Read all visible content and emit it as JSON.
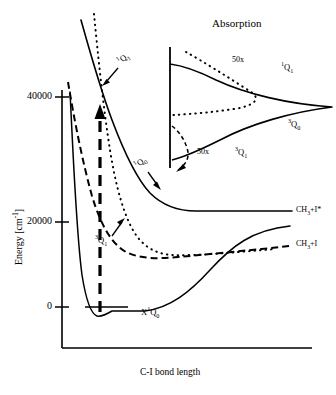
{
  "figure": {
    "axes": {
      "y_label": "Energy [cm-1]",
      "y_label_main": "Energy [cm",
      "y_label_exp": "-1",
      "y_label_close": "]",
      "x_label": "C-I bond length",
      "y_ticks": [
        "40000",
        "20000",
        "0"
      ],
      "y_tick_values": [
        40000,
        20000,
        0
      ]
    },
    "curves": [
      {
        "name": "X 1Q0",
        "label": "X",
        "label_sup": "1",
        "label_sub": "Q",
        "label_subidx": "0",
        "style": "solid",
        "role": "ground-state"
      },
      {
        "name": "3Q0",
        "label_sup": "3",
        "label_main": "Q",
        "label_sub": "0",
        "style": "solid",
        "role": "excited-state"
      },
      {
        "name": "1Q1",
        "label_sup": "1",
        "label_main": "Q",
        "label_sub": "1",
        "style": "dotted",
        "role": "excited-state"
      },
      {
        "name": "3Q1",
        "label_sup": "3",
        "label_main": "Q",
        "label_sub": "1",
        "style": "dashed",
        "role": "excited-state"
      }
    ],
    "state_labels": {
      "q1_upper": {
        "sup": "1",
        "main": "Q",
        "sub": "1"
      },
      "q0_mid": {
        "sup": "1",
        "main": "Q",
        "sub": "0"
      },
      "q1_lower": {
        "sup": "3",
        "main": "Q",
        "sub": "1"
      },
      "ground": {
        "pre": "X",
        "sup": "1",
        "main": "Q",
        "sub": "0"
      }
    },
    "products": [
      {
        "id": "excited",
        "formula": "CH",
        "sub": "3",
        "tail": "+I*"
      },
      {
        "id": "ground",
        "formula": "CH",
        "sub": "3",
        "tail": "+I"
      }
    ],
    "inset": {
      "title": "Absorption",
      "labels": [
        {
          "id": "q1-singlet",
          "sup": "1",
          "main": "Q",
          "sub": "1"
        },
        {
          "id": "q0-triplet",
          "sup": "3",
          "main": "Q",
          "sub": "0"
        },
        {
          "id": "q1-triplet",
          "sup": "3",
          "main": "Q",
          "sub": "1"
        }
      ],
      "magnifications": [
        "50x",
        "50x"
      ]
    },
    "colors": {
      "ink": "#000000",
      "background": "#ffffff"
    }
  }
}
